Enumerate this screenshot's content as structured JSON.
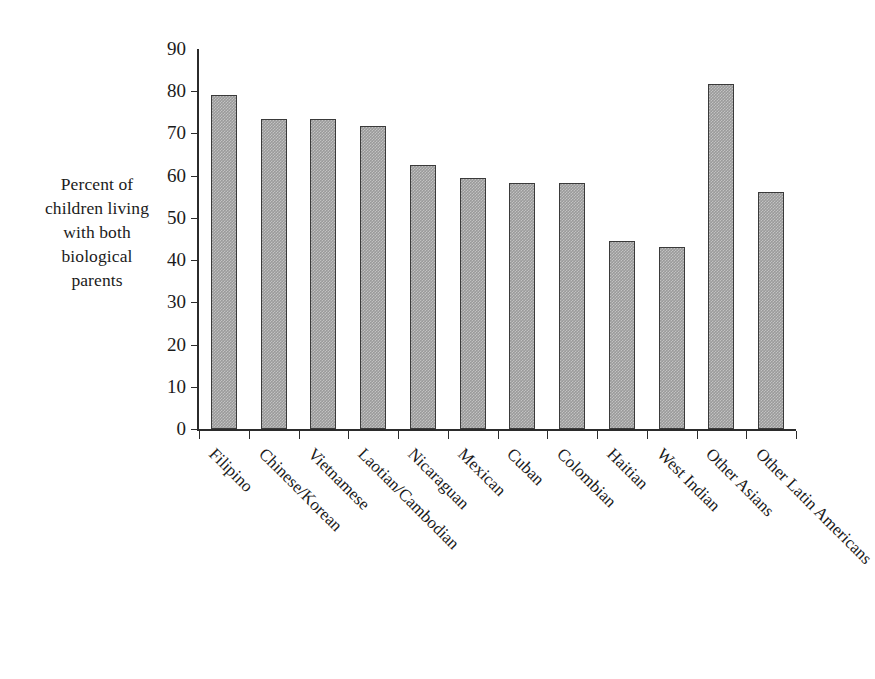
{
  "axis_title": {
    "lines": [
      "Percent of",
      "children living",
      "with both",
      "biological",
      "parents"
    ]
  },
  "chart_data": {
    "type": "bar",
    "title": "",
    "xlabel": "",
    "ylabel": "Percent of children living with both biological parents",
    "ylim": [
      0,
      90
    ],
    "ytick_step": 10,
    "grid": false,
    "legend": "none",
    "bar_color": "#9a9a9a",
    "bar_border_color": "#3a3a3a",
    "categories": [
      "Filipino",
      "Chinese/Korean",
      "Vietnamese",
      "Laotian/Cambodian",
      "Nicaraguan",
      "Mexican",
      "Cuban",
      "Colombian",
      "Haitian",
      "West Indian",
      "Other Asians",
      "Other Latin Americans"
    ],
    "values": [
      79.2,
      73.5,
      73.5,
      71.7,
      62.5,
      59.5,
      58.3,
      58.3,
      44.5,
      43.0,
      81.8,
      56.2
    ],
    "ytick_labels": [
      "90",
      "80",
      "70",
      "60",
      "50",
      "40",
      "30",
      "20",
      "10",
      "0"
    ],
    "ytick_values": [
      90,
      80,
      70,
      60,
      50,
      40,
      30,
      20,
      10,
      0
    ]
  }
}
